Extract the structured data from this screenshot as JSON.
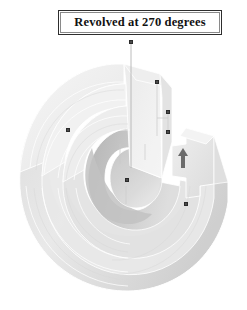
{
  "caption": {
    "text": "Revolved at 270 degrees",
    "border_color": "#2e2e2e",
    "text_color": "#111111"
  },
  "viewport": {
    "background": "#ffffff",
    "model": {
      "name": "revolved-solid",
      "description": "270 degree revolved stepped ring solid",
      "revolve_angle_degrees": 270,
      "shading": {
        "face_light": "#f2f2f2",
        "face_mid": "#e4e4e4",
        "face_dark": "#cfcfcf",
        "face_darkest": "#b9b9b9",
        "edge": "#ffffff",
        "edge_soft": "#dcdcdc"
      }
    },
    "axis": {
      "name": "revolve-axis",
      "color": "#b0b0b0"
    },
    "direction_arrow": {
      "name": "revolve-direction-arrow",
      "glyph": "arrow-up",
      "color": "#6b6b6b"
    },
    "handles": [
      {
        "name": "handle-axis-top",
        "x": 130,
        "y": 40
      },
      {
        "name": "handle-axis-mid",
        "x": 156,
        "y": 82
      },
      {
        "name": "handle-axis-lower",
        "x": 160,
        "y": 96
      },
      {
        "name": "handle-profile-left",
        "x": 68,
        "y": 129
      },
      {
        "name": "handle-profile-right",
        "x": 186,
        "y": 203
      },
      {
        "name": "handle-profile-inner",
        "x": 126,
        "y": 166
      }
    ]
  }
}
